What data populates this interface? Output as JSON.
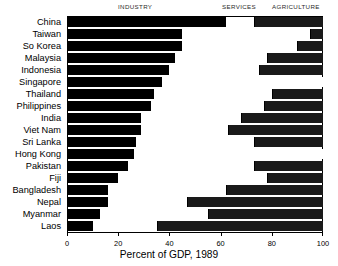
{
  "chart_data": {
    "type": "bar",
    "orientation": "horizontal",
    "stacked": true,
    "title": "",
    "xlabel": "Percent of GDP, 1989",
    "ylabel": "",
    "xlim": [
      0,
      100
    ],
    "xticks": [
      0,
      20,
      40,
      60,
      80,
      100
    ],
    "xtick_labels": [
      "0",
      "20",
      "40",
      "60",
      "80",
      "100"
    ],
    "grid": false,
    "legend_position": "top",
    "legend": [
      "INDUSTRY",
      "SERVICES",
      "AGRICULTURE"
    ],
    "series_colors": {
      "INDUSTRY": "#000000",
      "SERVICES": "#ffffff",
      "AGRICULTURE": "#1a1a1a"
    },
    "categories": [
      "China",
      "Taiwan",
      "So Korea",
      "Malaysia",
      "Indonesia",
      "Singapore",
      "Thailand",
      "Philippines",
      "India",
      "Viet Nam",
      "Sri Lanka",
      "Hong Kong",
      "Pakistan",
      "Fiji",
      "Bangladesh",
      "Nepal",
      "Myanmar",
      "Laos"
    ],
    "series": [
      {
        "name": "INDUSTRY",
        "values": [
          62,
          45,
          45,
          42,
          40,
          37,
          34,
          33,
          29,
          29,
          27,
          26,
          24,
          20,
          16,
          16,
          13,
          10
        ]
      },
      {
        "name": "SERVICES",
        "values": [
          11,
          50,
          45,
          36,
          35,
          63,
          46,
          44,
          39,
          34,
          46,
          74,
          49,
          58,
          46,
          31,
          42,
          25
        ]
      },
      {
        "name": "AGRICULTURE",
        "values": [
          27,
          5,
          10,
          22,
          25,
          0,
          20,
          23,
          32,
          37,
          27,
          0,
          27,
          22,
          38,
          53,
          45,
          65
        ]
      }
    ],
    "cumulative_boundaries": [
      {
        "country": "China",
        "industry_end": 62,
        "services_end": 73
      },
      {
        "country": "Taiwan",
        "industry_end": 45,
        "services_end": 95
      },
      {
        "country": "So Korea",
        "industry_end": 45,
        "services_end": 90
      },
      {
        "country": "Malaysia",
        "industry_end": 42,
        "services_end": 78
      },
      {
        "country": "Indonesia",
        "industry_end": 40,
        "services_end": 75
      },
      {
        "country": "Singapore",
        "industry_end": 37,
        "services_end": 100
      },
      {
        "country": "Thailand",
        "industry_end": 34,
        "services_end": 80
      },
      {
        "country": "Philippines",
        "industry_end": 33,
        "services_end": 77
      },
      {
        "country": "India",
        "industry_end": 29,
        "services_end": 68
      },
      {
        "country": "Viet Nam",
        "industry_end": 29,
        "services_end": 63
      },
      {
        "country": "Sri Lanka",
        "industry_end": 27,
        "services_end": 73
      },
      {
        "country": "Hong Kong",
        "industry_end": 26,
        "services_end": 100
      },
      {
        "country": "Pakistan",
        "industry_end": 24,
        "services_end": 73
      },
      {
        "country": "Fiji",
        "industry_end": 20,
        "services_end": 78
      },
      {
        "country": "Bangladesh",
        "industry_end": 16,
        "services_end": 62
      },
      {
        "country": "Nepal",
        "industry_end": 16,
        "services_end": 47
      },
      {
        "country": "Myanmar",
        "industry_end": 13,
        "services_end": 55
      },
      {
        "country": "Laos",
        "industry_end": 10,
        "services_end": 35
      }
    ]
  },
  "headers": {
    "industry": "INDUSTRY",
    "services": "SERVICES",
    "agriculture": "AGRICULTURE"
  },
  "axis": {
    "title": "Percent of GDP, 1989",
    "ticks": [
      "0",
      "20",
      "40",
      "60",
      "80",
      "100"
    ]
  }
}
